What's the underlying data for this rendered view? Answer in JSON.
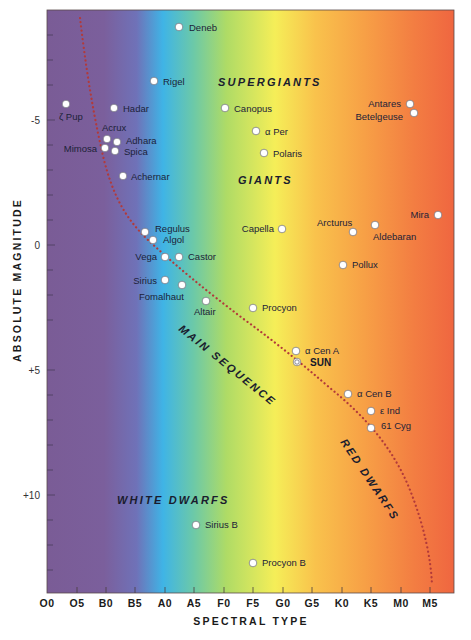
{
  "chart_data": {
    "type": "scatter",
    "xlabel": "SPECTRAL TYPE",
    "ylabel": "ABSOLUTE MAGNITUDE",
    "x_categories": [
      "O0",
      "O5",
      "B0",
      "B5",
      "A0",
      "A5",
      "F0",
      "F5",
      "G0",
      "G5",
      "K0",
      "K5",
      "M0",
      "M5"
    ],
    "y_ticks": [
      {
        "value": -5,
        "label": "-5"
      },
      {
        "value": 0,
        "label": "0"
      },
      {
        "value": 5,
        "label": "+5"
      },
      {
        "value": 10,
        "label": "+10"
      }
    ],
    "ylim": [
      -9.2,
      14.8
    ],
    "y_inverted": true,
    "grid": false,
    "background": "spectral color gradient (purple → blue → cyan → green → yellow → orange → red)",
    "gradient_colors": [
      "#7a5c96",
      "#7d62a0",
      "#5f7fc8",
      "#3cb6e6",
      "#8fd07a",
      "#c9e25c",
      "#f6ee58",
      "#f9c24c",
      "#f7a046",
      "#f37e42",
      "#ef6640"
    ],
    "region_labels": [
      {
        "text": "SUPERGIANTS",
        "x_type": "F0",
        "mag": -6.5
      },
      {
        "text": "GIANTS",
        "x_type": "F0",
        "mag": -2.7
      },
      {
        "text": "MAIN SEQUENCE",
        "rotated": true
      },
      {
        "text": "RED DWARFS",
        "rotated": true
      },
      {
        "text": "WHITE DWARFS",
        "x_type": "A0",
        "mag": 10.4
      }
    ],
    "main_sequence_curve": "dotted red line from upper left (O5, mag -9) curving down through Regulus, Vega, Altair, Sun, 61 Cyg to lower right (M5, mag +14.5)",
    "series": [
      {
        "name": "Deneb",
        "spectral": "A2",
        "mag": -8.4
      },
      {
        "name": "Rigel",
        "spectral": "B8",
        "mag": -6.6
      },
      {
        "name": "Hadar",
        "spectral": "B1",
        "mag": -5.4
      },
      {
        "name": "ζ Pup",
        "spectral": "O4",
        "mag": -5.7
      },
      {
        "name": "Acrux",
        "spectral": "B0.5",
        "mag": -4.4
      },
      {
        "name": "Adhara",
        "spectral": "B1",
        "mag": -4.2
      },
      {
        "name": "Mimosa",
        "spectral": "B0.5",
        "mag": -4.0
      },
      {
        "name": "Spica",
        "spectral": "B1",
        "mag": -3.9
      },
      {
        "name": "Achernar",
        "spectral": "B3",
        "mag": -2.8
      },
      {
        "name": "Canopus",
        "spectral": "F0",
        "mag": -5.4
      },
      {
        "name": "α Per",
        "spectral": "F5",
        "mag": -4.6
      },
      {
        "name": "Polaris",
        "spectral": "F7",
        "mag": -3.7
      },
      {
        "name": "Antares",
        "spectral": "M1",
        "mag": -5.6
      },
      {
        "name": "Betelgeuse",
        "spectral": "M2",
        "mag": -5.3
      },
      {
        "name": "Regulus",
        "spectral": "B7",
        "mag": -0.6
      },
      {
        "name": "Algol",
        "spectral": "B8",
        "mag": -0.3
      },
      {
        "name": "Vega",
        "spectral": "A0",
        "mag": 0.5
      },
      {
        "name": "Castor",
        "spectral": "A2",
        "mag": 0.5
      },
      {
        "name": "Sirius",
        "spectral": "A0",
        "mag": 1.4
      },
      {
        "name": "Fomalhaut",
        "spectral": "A3",
        "mag": 1.7
      },
      {
        "name": "Altair",
        "spectral": "A7",
        "mag": 2.3
      },
      {
        "name": "Capella",
        "spectral": "G0",
        "mag": -0.7
      },
      {
        "name": "Arcturus",
        "spectral": "K2",
        "mag": -0.5
      },
      {
        "name": "Aldebaran",
        "spectral": "K5",
        "mag": -0.7
      },
      {
        "name": "Mira",
        "spectral": "M5",
        "mag": -1.2
      },
      {
        "name": "Pollux",
        "spectral": "K0",
        "mag": 0.9
      },
      {
        "name": "Procyon",
        "spectral": "F5",
        "mag": 2.6
      },
      {
        "name": "α Cen A",
        "spectral": "G2",
        "mag": 4.4
      },
      {
        "name": "SUN",
        "spectral": "G2",
        "mag": 4.8
      },
      {
        "name": "α Cen B",
        "spectral": "K1",
        "mag": 6.0
      },
      {
        "name": "ε Ind",
        "spectral": "K5",
        "mag": 6.7
      },
      {
        "name": "61 Cyg",
        "spectral": "K5",
        "mag": 7.3
      },
      {
        "name": "Sirius B",
        "spectral": "A5",
        "mag": 11.3
      },
      {
        "name": "Procyon B",
        "spectral": "F5",
        "mag": 13.0
      }
    ]
  },
  "labels": {
    "x_title": "SPECTRAL TYPE",
    "y_title": "ABSOLUTE MAGNITUDE",
    "supergiants": "SUPERGIANTS",
    "giants": "GIANTS",
    "main_sequence": "MAIN SEQUENCE",
    "red_dwarfs": "RED DWARFS",
    "white_dwarfs": "WHITE DWARFS"
  },
  "x_ticks": [
    "O0",
    "O5",
    "B0",
    "B5",
    "A0",
    "A5",
    "F0",
    "F5",
    "G0",
    "G5",
    "K0",
    "K5",
    "M0",
    "M5"
  ],
  "y_ticks": [
    "-5",
    "0",
    "+5",
    "+10"
  ],
  "stars": [
    {
      "name": "Deneb",
      "x": 179,
      "y": 27,
      "lx": 189,
      "ly": 31,
      "anchor": "start"
    },
    {
      "name": "Rigel",
      "x": 154,
      "y": 81,
      "lx": 163,
      "ly": 85,
      "anchor": "start"
    },
    {
      "name": "Hadar",
      "x": 114,
      "y": 108,
      "lx": 123,
      "ly": 112,
      "anchor": "start"
    },
    {
      "name": "ζ Pup",
      "x": 66,
      "y": 104,
      "lx": 59,
      "ly": 120,
      "anchor": "start"
    },
    {
      "name": "Acrux",
      "x": 107,
      "y": 139,
      "lx": 102,
      "ly": 131,
      "anchor": "start"
    },
    {
      "name": "Adhara",
      "x": 117,
      "y": 142,
      "lx": 126,
      "ly": 144,
      "anchor": "start"
    },
    {
      "name": "Mimosa",
      "x": 105,
      "y": 148,
      "lx": 97,
      "ly": 152,
      "anchor": "end"
    },
    {
      "name": "Spica",
      "x": 115,
      "y": 151,
      "lx": 124,
      "ly": 155,
      "anchor": "start"
    },
    {
      "name": "Achernar",
      "x": 123,
      "y": 176,
      "lx": 131,
      "ly": 180,
      "anchor": "start"
    },
    {
      "name": "Canopus",
      "x": 225,
      "y": 108,
      "lx": 234,
      "ly": 112,
      "anchor": "start"
    },
    {
      "name": "α Per",
      "x": 256,
      "y": 131,
      "lx": 265,
      "ly": 135,
      "anchor": "start"
    },
    {
      "name": "Polaris",
      "x": 264,
      "y": 153,
      "lx": 273,
      "ly": 157,
      "anchor": "start"
    },
    {
      "name": "Antares",
      "x": 410,
      "y": 104,
      "lx": 401,
      "ly": 107,
      "anchor": "end"
    },
    {
      "name": "Betelgeuse",
      "x": 414,
      "y": 113,
      "lx": 403,
      "ly": 120,
      "anchor": "end"
    },
    {
      "name": "Regulus",
      "x": 145,
      "y": 232,
      "lx": 155,
      "ly": 232,
      "anchor": "start"
    },
    {
      "name": "Algol",
      "x": 153,
      "y": 240,
      "lx": 163,
      "ly": 243,
      "anchor": "start"
    },
    {
      "name": "Vega",
      "x": 165,
      "y": 257,
      "lx": 157,
      "ly": 260,
      "anchor": "end"
    },
    {
      "name": "Castor",
      "x": 179,
      "y": 257,
      "lx": 188,
      "ly": 260,
      "anchor": "start"
    },
    {
      "name": "Sirius",
      "x": 165,
      "y": 280,
      "lx": 157,
      "ly": 284,
      "anchor": "end"
    },
    {
      "name": "Fomalhaut",
      "x": 182,
      "y": 285,
      "lx": 139,
      "ly": 300,
      "anchor": "start"
    },
    {
      "name": "Altair",
      "x": 206,
      "y": 301,
      "lx": 194,
      "ly": 315,
      "anchor": "start"
    },
    {
      "name": "Capella",
      "x": 282,
      "y": 229,
      "lx": 274,
      "ly": 232,
      "anchor": "end"
    },
    {
      "name": "Arcturus",
      "x": 353,
      "y": 232,
      "lx": 317,
      "ly": 226,
      "anchor": "start"
    },
    {
      "name": "Aldebaran",
      "x": 375,
      "y": 225,
      "lx": 373,
      "ly": 240,
      "anchor": "start"
    },
    {
      "name": "Mira",
      "x": 438,
      "y": 215,
      "lx": 429,
      "ly": 218,
      "anchor": "end"
    },
    {
      "name": "Pollux",
      "x": 343,
      "y": 265,
      "lx": 352,
      "ly": 268,
      "anchor": "start"
    },
    {
      "name": "Procyon",
      "x": 253,
      "y": 308,
      "lx": 262,
      "ly": 311,
      "anchor": "start"
    },
    {
      "name": "α Cen A",
      "x": 296,
      "y": 351,
      "lx": 305,
      "ly": 354,
      "anchor": "start"
    },
    {
      "name": "SUN",
      "x": 297,
      "y": 362,
      "lx": 310,
      "ly": 366,
      "anchor": "start",
      "sun": true
    },
    {
      "name": "α Cen B",
      "x": 348,
      "y": 394,
      "lx": 357,
      "ly": 397,
      "anchor": "start"
    },
    {
      "name": "ε Ind",
      "x": 371,
      "y": 411,
      "lx": 380,
      "ly": 414,
      "anchor": "start"
    },
    {
      "name": "61 Cyg",
      "x": 371,
      "y": 428,
      "lx": 381,
      "ly": 429,
      "anchor": "start"
    },
    {
      "name": "Sirius B",
      "x": 196,
      "y": 525,
      "lx": 205,
      "ly": 528,
      "anchor": "start"
    },
    {
      "name": "Procyon B",
      "x": 253,
      "y": 563,
      "lx": 262,
      "ly": 566,
      "anchor": "start"
    }
  ]
}
